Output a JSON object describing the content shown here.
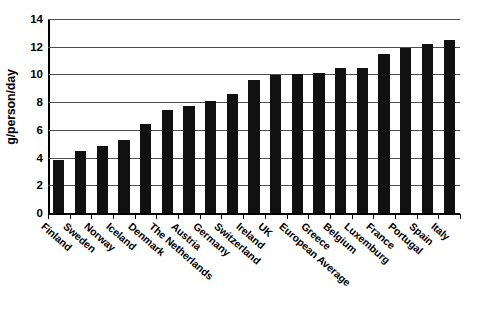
{
  "chart_data": {
    "type": "bar",
    "title": "",
    "xlabel": "",
    "ylabel": "g/person/day",
    "ylim": [
      0,
      14
    ],
    "ytick_step": 2,
    "yticks": [
      "0",
      "2",
      "4",
      "6",
      "8",
      "10",
      "12",
      "14"
    ],
    "grid": true,
    "legend": "none",
    "bar_color": "#111111",
    "categories": [
      "Finland",
      "Sweden",
      "Norway",
      "Iceland",
      "Denmark",
      "The Netherlands",
      "Austria",
      "Germany",
      "Switzerland",
      "Ireland",
      "UK",
      "European Average",
      "Greece",
      "Belgium",
      "Luxemburg",
      "France",
      "Portugal",
      "Spain",
      "Italy"
    ],
    "values": [
      3.8,
      4.5,
      4.85,
      5.3,
      6.4,
      7.4,
      7.7,
      8.1,
      8.6,
      9.6,
      9.95,
      10.0,
      10.1,
      10.45,
      10.5,
      11.5,
      11.9,
      12.2,
      12.5
    ]
  }
}
